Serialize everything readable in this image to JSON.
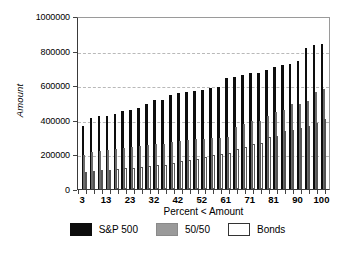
{
  "chart_data": {
    "type": "bar",
    "title": "",
    "xlabel": "Percent < Amount",
    "ylabel": "Amount",
    "ylim": [
      0,
      1000000
    ],
    "xlim": [
      0,
      100
    ],
    "yticks": [
      0,
      200000,
      400000,
      600000,
      800000,
      1000000
    ],
    "ytick_labels": [
      "0",
      "200000",
      "400000",
      "600000",
      "800000",
      "1000000"
    ],
    "xtick_labels": [
      "3",
      "13",
      "23",
      "32",
      "42",
      "52",
      "61",
      "71",
      "81",
      "90",
      "100"
    ],
    "xtick_values": [
      3,
      13,
      23,
      32,
      42,
      52,
      61,
      71,
      81,
      90,
      100
    ],
    "grid": true,
    "grid_axis": "y",
    "legend_position": "below",
    "categories": [
      3,
      6,
      9,
      13,
      16,
      19,
      23,
      26,
      29,
      32,
      35,
      39,
      42,
      45,
      48,
      52,
      55,
      58,
      61,
      65,
      68,
      71,
      74,
      77,
      81,
      84,
      87,
      90,
      94,
      97,
      100
    ],
    "series": [
      {
        "name": "S&P 500",
        "color": "#0d0d0d",
        "values": [
          365000,
          408000,
          424000,
          424000,
          434000,
          452000,
          455000,
          467000,
          494000,
          512000,
          514000,
          545000,
          553000,
          561000,
          566000,
          570000,
          584000,
          592000,
          643000,
          650000,
          659000,
          668000,
          668000,
          686000,
          703000,
          716000,
          721000,
          741000,
          816000,
          830000,
          838000
        ]
      },
      {
        "name": "50/50",
        "color": "#9a9a9a",
        "values": [
          198000,
          215000,
          222000,
          224000,
          231000,
          236000,
          240000,
          246000,
          252000,
          258000,
          262000,
          272000,
          277000,
          285000,
          288000,
          289000,
          292000,
          296000,
          301000,
          356000,
          374000,
          393000,
          396000,
          423000,
          445000,
          456000,
          489000,
          492000,
          511000,
          559000,
          578000
        ]
      },
      {
        "name": "Bonds",
        "color": "#ffffff",
        "values": [
          101000,
          106000,
          110000,
          112000,
          116000,
          121000,
          124000,
          128000,
          131000,
          136000,
          140000,
          151000,
          160000,
          168000,
          174000,
          186000,
          194000,
          201000,
          210000,
          232000,
          245000,
          258000,
          268000,
          299000,
          305000,
          334000,
          341000,
          352000,
          363000,
          381000,
          402000
        ]
      }
    ]
  },
  "legend": {
    "items": [
      {
        "label": "S&P 500",
        "swatch": "black-swatch"
      },
      {
        "label": "50/50",
        "swatch": "gray-swatch"
      },
      {
        "label": "Bonds",
        "swatch": "white-swatch"
      }
    ]
  }
}
